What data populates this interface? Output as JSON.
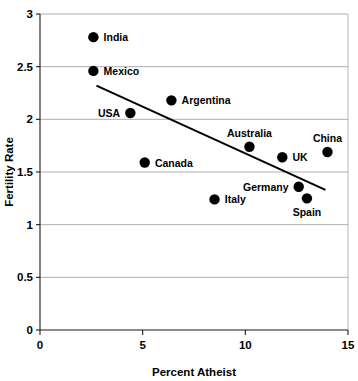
{
  "chart_data": {
    "type": "scatter",
    "title": "",
    "xlabel": "Percent Atheist",
    "ylabel": "Fertility Rate",
    "xlim": [
      0,
      15
    ],
    "ylim": [
      0,
      3
    ],
    "xticks": [
      "0",
      "5",
      "10",
      "15"
    ],
    "xtick_values": [
      0,
      5,
      10,
      15
    ],
    "yticks": [
      "0",
      "0.5",
      "1",
      "1.5",
      "2",
      "2.5",
      "3"
    ],
    "ytick_values": [
      0,
      0.5,
      1,
      1.5,
      2,
      2.5,
      3
    ],
    "grid": true,
    "grid_axis": "y",
    "legend": "none",
    "points": [
      {
        "label": "India",
        "x": 2.6,
        "y": 2.78,
        "label_pos": "right"
      },
      {
        "label": "Mexico",
        "x": 2.6,
        "y": 2.46,
        "label_pos": "right"
      },
      {
        "label": "USA",
        "x": 4.4,
        "y": 2.06,
        "label_pos": "left"
      },
      {
        "label": "Argentina",
        "x": 6.4,
        "y": 2.18,
        "label_pos": "right"
      },
      {
        "label": "Canada",
        "x": 5.1,
        "y": 1.59,
        "label_pos": "right"
      },
      {
        "label": "Australia",
        "x": 10.2,
        "y": 1.74,
        "label_pos": "above"
      },
      {
        "label": "UK",
        "x": 11.8,
        "y": 1.64,
        "label_pos": "right"
      },
      {
        "label": "China",
        "x": 14.0,
        "y": 1.69,
        "label_pos": "above"
      },
      {
        "label": "Germany",
        "x": 12.6,
        "y": 1.36,
        "label_pos": "left"
      },
      {
        "label": "Spain",
        "x": 13.0,
        "y": 1.25,
        "label_pos": "below"
      },
      {
        "label": "Italy",
        "x": 8.5,
        "y": 1.24,
        "label_pos": "right"
      }
    ],
    "trendline": {
      "x_start": 2.75,
      "y_start": 2.32,
      "x_end": 13.9,
      "y_end": 1.33
    },
    "marker_color": "#000000",
    "trendline_color": "#000000",
    "grid_color": "#8c8c8c",
    "background_color": "#ffffff"
  }
}
